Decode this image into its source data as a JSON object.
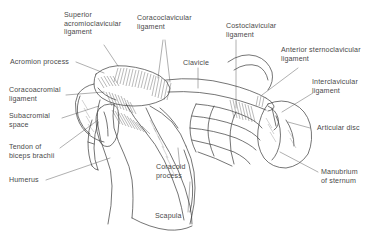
{
  "figure": {
    "kind": "anatomical-line-drawing",
    "style": "pen-and-ink hatched medical illustration",
    "background_color": "#ffffff",
    "ink_color": "#3f3f3f",
    "label_color": "#4a4a4a",
    "leader_color": "#6e6e6e"
  },
  "labels": {
    "superior_acromioclavicular_ligament": "Superior\nacromioclavicular\nligament",
    "coracoclavicular_ligament": "Coracoclavicular\nligament",
    "costoclavicular_ligament": "Costoclavicular\nligament",
    "anterior_sternoclavicular_ligament": "Anterior sternoclavicular\nligament",
    "interclavicular_ligament": "Interclavicular\nligament",
    "acromion_process": "Acromion process",
    "coracoacromial_ligament": "Coracoacromial\nligament",
    "subacromial_space": "Subacromial\nspace",
    "tendon_of_biceps_brachii": "Tendon of\nbiceps brachii",
    "humerus": "Humerus",
    "clavicle": "Clavicle",
    "articular_disc": "Articular disc",
    "manubrium_of_sternum": "Manubrium\nof sternum",
    "coracoid_process": "Coracoid\nprocess",
    "scapula": "Scapula"
  },
  "structures": [
    "acromion",
    "clavicle",
    "coracoid process",
    "scapula",
    "humerus head",
    "manubrium of sternum",
    "first rib and costal cartilage",
    "articular disc",
    "ligament hatching"
  ]
}
